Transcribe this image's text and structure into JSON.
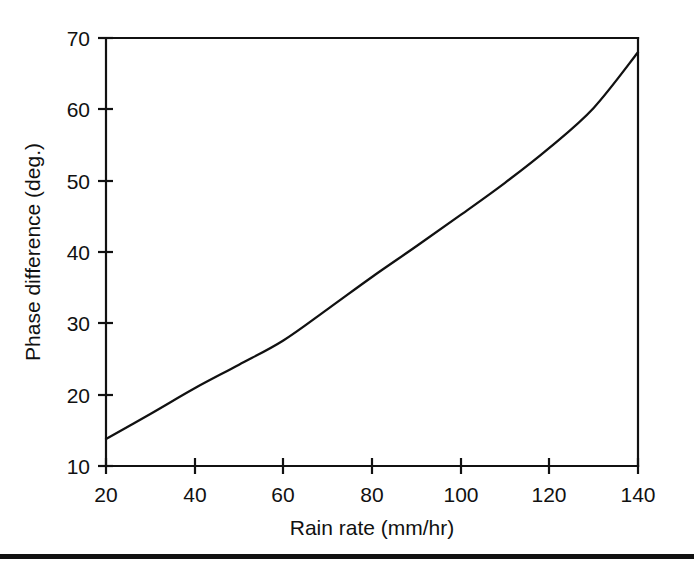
{
  "chart_data": {
    "type": "line",
    "title": "",
    "xlabel": "Rain rate (mm/hr)",
    "ylabel": "Phase difference (deg.)",
    "xlim": [
      20,
      140
    ],
    "ylim": [
      10,
      70
    ],
    "xticks": [
      20,
      40,
      60,
      80,
      100,
      120,
      140
    ],
    "yticks": [
      10,
      20,
      30,
      40,
      50,
      60,
      70
    ],
    "xtick_labels": [
      "20",
      "40",
      "60",
      "80",
      "100",
      "120",
      "140"
    ],
    "ytick_labels": [
      "10",
      "20",
      "30",
      "40",
      "50",
      "60",
      "70"
    ],
    "grid": false,
    "legend": null,
    "series": [
      {
        "name": "Phase difference",
        "color": "#111111",
        "x": [
          20,
          30,
          40,
          50,
          60,
          70,
          80,
          90,
          100,
          110,
          120,
          130,
          140
        ],
        "values": [
          13.8,
          17.3,
          20.9,
          24.2,
          27.6,
          32.0,
          36.5,
          40.8,
          45.2,
          49.7,
          54.6,
          60.2,
          68.0
        ]
      }
    ]
  },
  "figure": {
    "axis_color": "#111111",
    "background": "#ffffff",
    "rule_color": "#111111"
  }
}
